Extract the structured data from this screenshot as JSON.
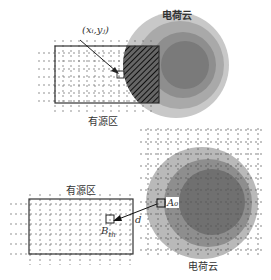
{
  "diagram": {
    "top_panel": {
      "cloud_label": "电荷云",
      "source_label": "有源区",
      "point_label": "(x_i,y_j)",
      "point_label_display": "(xᵢ,yⱼ)"
    },
    "bottom_panel": {
      "cloud_label": "电荷云",
      "source_label": "有源区",
      "cell_a_label": "A_0",
      "cell_a_display": "A₀",
      "cell_b_label": "B_th",
      "cell_b_main": "B",
      "cell_b_sub": "th",
      "distance_label": "d"
    },
    "colors": {
      "cloud_outer": "#c8c8c8",
      "cloud_mid": "#a9a9a9",
      "cloud_inner": "#8a8a8a",
      "cloud_core": "#6e6e6e",
      "grid": "#555555",
      "box": "#333333"
    }
  }
}
